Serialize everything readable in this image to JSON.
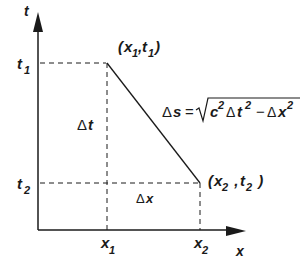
{
  "diagram": {
    "type": "spacetime-interval",
    "axes": {
      "x_label": "x",
      "t_label": "t"
    },
    "points": [
      {
        "name": "point-1",
        "label_open": "(",
        "x_sym": "x",
        "x_sub": "1",
        "sep": ",",
        "t_sym": "t",
        "t_sub": "1",
        "label_close": ")"
      },
      {
        "name": "point-2",
        "label_open": "(",
        "x_sym": "x",
        "x_sub": "2",
        "sep": " , ",
        "t_sym": "t",
        "t_sub": "2",
        "label_close": " )"
      }
    ],
    "ticks": {
      "t1": {
        "sym": "t",
        "sub": "1"
      },
      "t2": {
        "sym": "t",
        "sub": "2"
      },
      "x1": {
        "sym": "x",
        "sub": "1"
      },
      "x2": {
        "sym": "x",
        "sub": "2"
      }
    },
    "delta_t": {
      "delta": "Δ",
      "sym": "t"
    },
    "delta_x": {
      "delta": "Δ",
      "sym": "x"
    },
    "formula": {
      "lhs_delta": "Δ",
      "lhs_sym": "s",
      "equals": "=",
      "c": "c",
      "c_exp": "2",
      "dt_delta": "Δ",
      "dt_sym": "t",
      "dt_exp": "2",
      "minus": "−",
      "dx_delta": "Δ",
      "dx_sym": "x",
      "dx_exp": "2"
    },
    "colors": {
      "ink": "#1a1a1a",
      "background": "#ffffff"
    }
  }
}
